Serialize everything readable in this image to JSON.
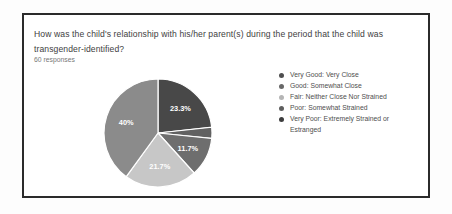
{
  "page": {
    "background": "#fdfdfd"
  },
  "card": {
    "border_color": "#2b2b2b",
    "question_lines": [
      "How was the child's relationship with his/her parent(s) during the period that the child was",
      "transgender-identified?"
    ],
    "responses_label": "60 responses"
  },
  "chart_data": {
    "type": "pie",
    "title": "How was the child's relationship with his/her parent(s) during the period that the child was transgender-identified?",
    "subtitle": "60 responses",
    "total_responses": 60,
    "legend_position": "right",
    "start_angle": "12-oclock",
    "direction": "clockwise",
    "pct_label_color": "#ffffff",
    "slices": [
      {
        "label": "Very Good: Very Close",
        "pct": 23.3,
        "pct_label": "23.3%",
        "label_visible": true,
        "slice_color": "#484848",
        "dot_color": "#4f4f4f"
      },
      {
        "label": "Good: Somewhat Close",
        "pct": 3.3,
        "pct_label": "",
        "label_visible": false,
        "slice_color": "#616161",
        "dot_color": "#686868"
      },
      {
        "label": "Fair: Neither Close Nor Strained",
        "pct": 11.7,
        "pct_label": "11.7%",
        "label_visible": true,
        "slice_color": "#6e6e6e",
        "dot_color": "#b5b5b5"
      },
      {
        "label": "Poor: Somewhat Strained",
        "pct": 21.7,
        "pct_label": "21.7%",
        "label_visible": true,
        "slice_color": "#c7c7c7",
        "dot_color": "#5e5e5e"
      },
      {
        "label": "Very Poor: Extremely Strained or Estranged",
        "pct": 40.0,
        "pct_label": "40%",
        "label_visible": true,
        "slice_color": "#8b8b8b",
        "dot_color": "#3d3d3d"
      }
    ]
  }
}
